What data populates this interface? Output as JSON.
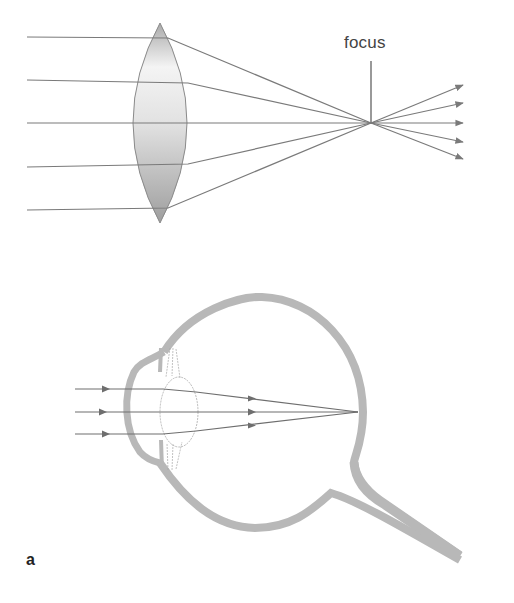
{
  "figure": {
    "panel_label": "a",
    "lens_diagram": {
      "focus_label": "focus",
      "incoming_rays": 5,
      "outgoing_rays": 5
    },
    "eye_diagram": {
      "incoming_rays": 3
    }
  },
  "colors": {
    "ray": "#7a7a7a",
    "lens_fill_light": "#f4f4f4",
    "lens_fill_dark": "#a9a9a9",
    "eye_wall": "#b8b8b8",
    "text": "#444444"
  }
}
